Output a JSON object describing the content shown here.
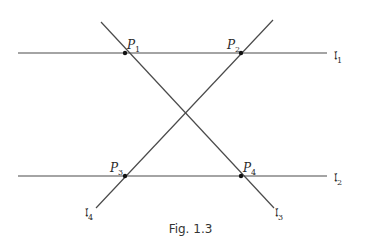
{
  "caption": "Fig. 1.3",
  "colors": {
    "line": "#4a4a4a",
    "point": "#111111",
    "text": "#2a2a2a"
  },
  "lines": [
    {
      "id": "l1",
      "symbol": "𝔩",
      "index": "1",
      "x1": 18,
      "y1": 53,
      "x2": 327,
      "y2": 53,
      "label_x": 334,
      "label_y": 50
    },
    {
      "id": "l2",
      "symbol": "𝔩",
      "index": "2",
      "x1": 18,
      "y1": 176,
      "x2": 327,
      "y2": 176,
      "label_x": 334,
      "label_y": 172
    },
    {
      "id": "l3",
      "symbol": "𝔩",
      "index": "3",
      "x1": 101,
      "y1": 22,
      "x2": 274,
      "y2": 208,
      "label_x": 275,
      "label_y": 207
    },
    {
      "id": "l4",
      "symbol": "𝔩",
      "index": "4",
      "x1": 96,
      "y1": 208,
      "x2": 273,
      "y2": 20,
      "label_x": 85,
      "label_y": 207
    }
  ],
  "points": [
    {
      "id": "P1",
      "name": "P",
      "index": "1",
      "x": 125,
      "y": 53,
      "label_x": 127,
      "label_y": 39
    },
    {
      "id": "P2",
      "name": "P",
      "index": "2",
      "x": 241,
      "y": 53,
      "label_x": 227,
      "label_y": 39
    },
    {
      "id": "P3",
      "name": "P",
      "index": "3",
      "x": 125,
      "y": 176,
      "label_x": 110,
      "label_y": 162
    },
    {
      "id": "P4",
      "name": "P",
      "index": "4",
      "x": 241,
      "y": 176,
      "label_x": 243,
      "label_y": 162
    }
  ]
}
